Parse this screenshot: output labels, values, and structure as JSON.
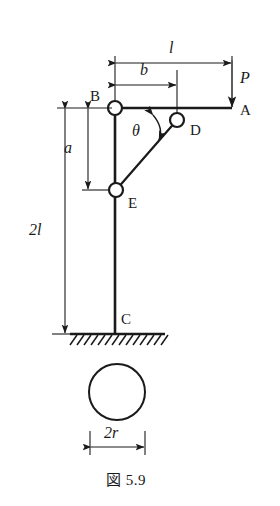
{
  "figure": {
    "caption": "図 5.9",
    "stroke_color": "#1a1a1a",
    "joint_fill_color": "#ffffff",
    "background_color": "#ffffff"
  },
  "joints": [
    {
      "name": "B",
      "label": "B",
      "x": 115,
      "y": 108,
      "r": 7
    },
    {
      "name": "D",
      "label": "D",
      "x": 177,
      "y": 120,
      "r": 7
    },
    {
      "name": "E",
      "label": "E",
      "x": 116,
      "y": 190,
      "r": 7
    }
  ],
  "points": [
    {
      "name": "A",
      "label": "A",
      "x": 232,
      "y": 108
    },
    {
      "name": "C",
      "label": "C",
      "x": 115,
      "y": 322
    }
  ],
  "labels": {
    "point_a": "A",
    "point_b": "B",
    "point_c": "C",
    "point_d": "D",
    "point_e": "E",
    "load_p": "P",
    "angle_theta": "θ",
    "dim_l": "l",
    "dim_b": "b",
    "dim_a": "a",
    "dim_2l": "2l",
    "dim_2r": "2r"
  },
  "dimensions": [
    {
      "name": "l",
      "label": "l",
      "orientation": "horizontal",
      "from": 115,
      "to": 232,
      "at": 63,
      "label_x": 172,
      "label_y": 48
    },
    {
      "name": "b",
      "label": "b",
      "orientation": "horizontal",
      "from": 115,
      "to": 177,
      "at": 85,
      "label_x": 143,
      "label_y": 70
    },
    {
      "name": "a",
      "label": "a",
      "orientation": "vertical",
      "from": 108,
      "to": 190,
      "at": 88,
      "label_x": 67,
      "label_y": 149
    },
    {
      "name": "2l",
      "label": "2l",
      "orientation": "vertical",
      "from": 108,
      "to": 334,
      "at": 65,
      "label_x": 33,
      "label_y": 232
    },
    {
      "name": "2r",
      "label": "2r",
      "orientation": "horizontal",
      "from": 90,
      "to": 145,
      "at": 447,
      "label_x": 108,
      "label_y": 434
    }
  ],
  "load": {
    "symbol": "P",
    "x": 232,
    "from_y": 60,
    "to_y": 108,
    "label_x": 243,
    "label_y": 80,
    "direction": "down"
  },
  "angle": {
    "symbol": "θ",
    "label_x": 137,
    "label_y": 133,
    "between": [
      "column-BC",
      "link-DE"
    ]
  },
  "members": [
    {
      "name": "column-BC",
      "from": [
        115,
        108
      ],
      "to": [
        115,
        334
      ]
    },
    {
      "name": "beam-BA",
      "from": [
        115,
        108
      ],
      "to": [
        232,
        108
      ]
    },
    {
      "name": "link-DE",
      "from": [
        177,
        120
      ],
      "to": [
        116,
        190
      ]
    }
  ],
  "ground": {
    "name": "fixed-support-hatching",
    "line_from_x": 70,
    "line_to_x": 165,
    "y": 334,
    "hatch_count": 14
  },
  "cross_section": {
    "name": "circular-cross-section",
    "cx": 117,
    "cy": 392,
    "r": 28,
    "diameter_label": "2r"
  }
}
